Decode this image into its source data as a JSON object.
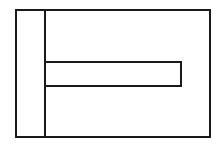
{
  "diagram": {
    "type": "line-drawing",
    "stroke_color": "#1a1a1a",
    "background": "#ffffff",
    "stroke_width": 2,
    "shapes": {
      "outer_rect": {
        "x": 16,
        "y": 10,
        "width": 194,
        "height": 127
      },
      "vertical_divider": {
        "x": 45,
        "y1": 10,
        "y2": 137
      },
      "inner_bar": {
        "x": 45,
        "y": 62,
        "width": 136,
        "height": 24
      }
    }
  }
}
